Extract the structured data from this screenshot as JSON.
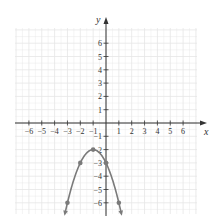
{
  "chart_data": {
    "type": "line",
    "title": "",
    "xlabel": "x",
    "ylabel": "y",
    "xlim": [
      -7,
      7
    ],
    "ylim": [
      -7,
      7
    ],
    "grid": true,
    "x_ticks": [
      -6,
      -5,
      -4,
      -3,
      -2,
      -1,
      1,
      2,
      3,
      4,
      5,
      6
    ],
    "y_ticks": [
      6,
      5,
      4,
      3,
      2,
      1,
      -1,
      -2,
      -3,
      -4,
      -5,
      -6
    ],
    "x_tick_labels": [
      "−6",
      "−5",
      "−4",
      "−3",
      "−2",
      "−1",
      "1",
      "2",
      "3",
      "4",
      "5",
      "6"
    ],
    "y_tick_labels": [
      "6",
      "5",
      "4",
      "3",
      "2",
      "1",
      "−1",
      "−2",
      "−3",
      "−4",
      "−5",
      "−6"
    ],
    "series": [
      {
        "name": "parabola",
        "equation": "y = -(x+1)^2 - 2",
        "points": [
          {
            "x": -3,
            "y": -6
          },
          {
            "x": -2,
            "y": -3
          },
          {
            "x": -1,
            "y": -2
          },
          {
            "x": 0,
            "y": -3
          },
          {
            "x": 1,
            "y": -6
          }
        ],
        "arrows_at_ends": true,
        "color": "#7a7a7a"
      }
    ]
  },
  "style": {
    "grid_color": "#e6e6e6",
    "axis_color": "#333333",
    "curve_color": "#7a7a7a",
    "point_color": "#7a7a7a"
  }
}
